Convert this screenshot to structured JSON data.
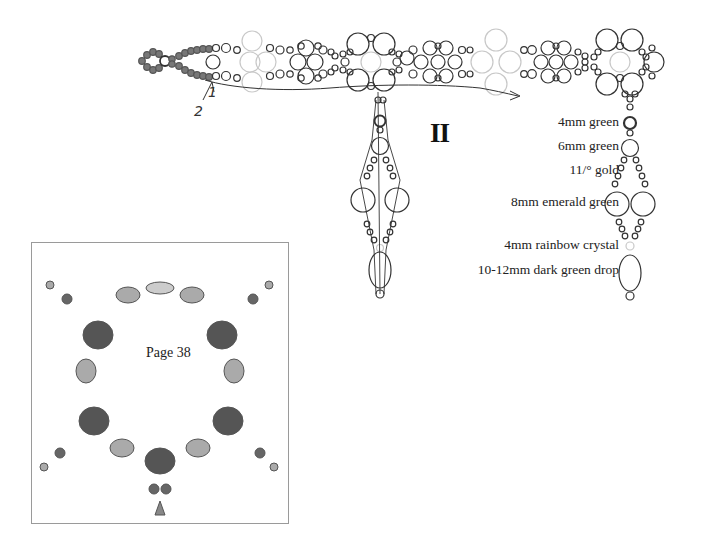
{
  "diagram": {
    "section_label": "II",
    "thread_path_labels": [
      "1",
      "2"
    ],
    "legend": [
      {
        "label": "4mm green",
        "shape": "small-bold-circle"
      },
      {
        "label": "6mm green",
        "shape": "medium-circle"
      },
      {
        "label": "11/° gold",
        "shape": "tiny-circle"
      },
      {
        "label": "8mm emerald green",
        "shape": "large-circle"
      },
      {
        "label": "4mm rainbow crystal",
        "shape": "light-small-circle"
      },
      {
        "label": "10-12mm dark green drop",
        "shape": "oval"
      }
    ],
    "colors": {
      "outline": "#333333",
      "light_bead": "#c8c8c8",
      "filled_bead": "#777777"
    }
  },
  "photo": {
    "caption": "Page 38",
    "subject": "beaded bracelet with dangling drops"
  }
}
